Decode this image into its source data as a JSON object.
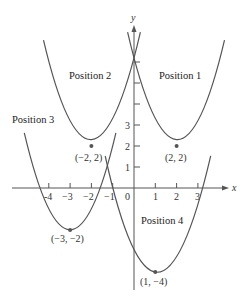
{
  "diagram": {
    "title": "",
    "axes": {
      "x_label": "x",
      "y_label": "y",
      "x_ticks": [
        {
          "value": -4,
          "label": "-4"
        },
        {
          "value": -3,
          "label": "−3"
        },
        {
          "value": -2,
          "label": "−2"
        },
        {
          "value": -1,
          "label": "−1"
        },
        {
          "value": 0,
          "label": "0"
        },
        {
          "value": 1,
          "label": "1"
        },
        {
          "value": 2,
          "label": "2"
        },
        {
          "value": 3,
          "label": "3"
        }
      ],
      "y_ticks": [
        {
          "value": 1,
          "label": "1"
        },
        {
          "value": 2,
          "label": "2"
        },
        {
          "value": 3,
          "label": "3"
        },
        {
          "value": 4,
          "label": ""
        },
        {
          "value": 5,
          "label": ""
        },
        {
          "value": 6,
          "label": ""
        }
      ]
    },
    "parabolas": [
      {
        "name": "Position 1",
        "label": "Position 1",
        "vertex": [
          2,
          2
        ],
        "vertex_label": "(2, 2)",
        "x_range": [
          -0.3,
          4.25
        ]
      },
      {
        "name": "Position 2",
        "label": "Position 2",
        "vertex": [
          -2,
          2
        ],
        "vertex_label": "(−2, 2)",
        "x_range": [
          -4.25,
          0.3
        ]
      },
      {
        "name": "Position 3",
        "label": "Position 3",
        "vertex": [
          -3,
          -2
        ],
        "vertex_label": "(−3, −2)",
        "x_range": [
          -5.15,
          -0.85
        ]
      },
      {
        "name": "Position 4",
        "label": "Position 4",
        "vertex": [
          1,
          -4
        ],
        "vertex_label": "(1, −4)",
        "x_range": [
          -1.35,
          3.6
        ]
      }
    ],
    "colors": {
      "curve": "#555555",
      "text": "#333333",
      "background": "#ffffff"
    }
  }
}
